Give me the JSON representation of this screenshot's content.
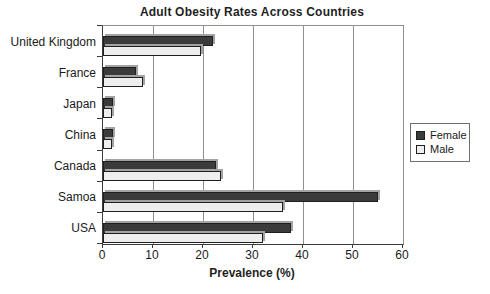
{
  "chart_data": {
    "type": "bar",
    "orientation": "horizontal",
    "title": "Adult Obesity Rates Across Countries",
    "xlabel": "Prevalence (%)",
    "xlim": [
      0,
      60
    ],
    "xticks": [
      0,
      10,
      20,
      30,
      40,
      50,
      60
    ],
    "grid": true,
    "legend_position": "right-middle",
    "categories": [
      "United Kingdom",
      "France",
      "Japan",
      "China",
      "Canada",
      "Samoa",
      "USA"
    ],
    "series": [
      {
        "name": "Female",
        "color": "#3b3b3b",
        "values": [
          22,
          6.5,
          2,
          2,
          22.5,
          55,
          37.5
        ]
      },
      {
        "name": "Male",
        "color": "#eeeeee",
        "values": [
          19.5,
          8,
          1.7,
          1.7,
          23.5,
          36,
          32
        ]
      }
    ],
    "colors": {
      "female_bar": "#3b3b3b",
      "male_bar": "#eeeeee",
      "bar_shadow": "#a3a3a3",
      "gridline": "#8f8f8f",
      "axis": "#3c3c3c",
      "text": "#1a1a1a"
    }
  }
}
